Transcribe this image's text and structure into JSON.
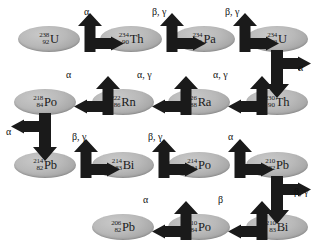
{
  "diagram": {
    "colors": {
      "background": "#ffffff",
      "node_fill": "#b9b9b9",
      "node_shadow": "#9a9a9a",
      "arrow": "#1a1a1a",
      "text": "#111111"
    }
  },
  "nodes": [
    {
      "id": "u238",
      "mass": "238",
      "atomic": "92",
      "symbol": "U",
      "x": 18,
      "y": 26
    },
    {
      "id": "th234",
      "mass": "234",
      "atomic": "90",
      "symbol": "Th",
      "x": 100,
      "y": 26
    },
    {
      "id": "pa234",
      "mass": "234",
      "atomic": "91",
      "symbol": "Pa",
      "x": 173,
      "y": 26
    },
    {
      "id": "u234",
      "mass": "234",
      "atomic": "92",
      "symbol": "U",
      "x": 246,
      "y": 26
    },
    {
      "id": "th230",
      "mass": "230",
      "atomic": "90",
      "symbol": "Th",
      "x": 246,
      "y": 89
    },
    {
      "id": "ra226",
      "mass": "226",
      "atomic": "88",
      "symbol": "Ra",
      "x": 168,
      "y": 89
    },
    {
      "id": "rn222",
      "mass": "222",
      "atomic": "86",
      "symbol": "Rn",
      "x": 92,
      "y": 89
    },
    {
      "id": "po218",
      "mass": "218",
      "atomic": "84",
      "symbol": "Po",
      "x": 14,
      "y": 89
    },
    {
      "id": "pb214",
      "mass": "214",
      "atomic": "82",
      "symbol": "Pb",
      "x": 14,
      "y": 152
    },
    {
      "id": "bi214",
      "mass": "214",
      "atomic": "83",
      "symbol": "Bi",
      "x": 92,
      "y": 152
    },
    {
      "id": "po214",
      "mass": "214",
      "atomic": "84",
      "symbol": "Po",
      "x": 168,
      "y": 152
    },
    {
      "id": "pb210",
      "mass": "210",
      "atomic": "82",
      "symbol": "Pb",
      "x": 246,
      "y": 152
    },
    {
      "id": "bi210",
      "mass": "210",
      "atomic": "83",
      "symbol": "Bi",
      "x": 246,
      "y": 214
    },
    {
      "id": "po210",
      "mass": "210",
      "atomic": "84",
      "symbol": "Po",
      "x": 168,
      "y": 214
    },
    {
      "id": "pb206",
      "mass": "206",
      "atomic": "82",
      "symbol": "Pb",
      "x": 92,
      "y": 214
    }
  ],
  "decays": [
    {
      "id": "d1",
      "from": "u238",
      "to": "th234",
      "emission": "α",
      "direction": "right",
      "label_x": 84,
      "label_y": 6
    },
    {
      "id": "d2",
      "from": "th234",
      "to": "pa234",
      "emission": "β, γ",
      "direction": "right",
      "label_x": 152,
      "label_y": 6
    },
    {
      "id": "d3",
      "from": "pa234",
      "to": "u234",
      "emission": "β, γ",
      "direction": "right",
      "label_x": 225,
      "label_y": 6
    },
    {
      "id": "d4",
      "from": "u234",
      "to": "th230",
      "emission": "α",
      "direction": "down",
      "label_x": 298,
      "label_y": 62
    },
    {
      "id": "d5",
      "from": "th230",
      "to": "ra226",
      "emission": "α, γ",
      "direction": "left",
      "label_x": 213,
      "label_y": 69
    },
    {
      "id": "d6",
      "from": "ra226",
      "to": "rn222",
      "emission": "α, γ",
      "direction": "left",
      "label_x": 137,
      "label_y": 69
    },
    {
      "id": "d7",
      "from": "rn222",
      "to": "po218",
      "emission": "α",
      "direction": "left",
      "label_x": 66,
      "label_y": 69
    },
    {
      "id": "d8",
      "from": "po218",
      "to": "pb214",
      "emission": "α",
      "direction": "down",
      "label_x": 6,
      "label_y": 126
    },
    {
      "id": "d9",
      "from": "pb214",
      "to": "bi214",
      "emission": "β, γ",
      "direction": "right",
      "label_x": 72,
      "label_y": 131
    },
    {
      "id": "d10",
      "from": "bi214",
      "to": "po214",
      "emission": "β, γ",
      "direction": "right",
      "label_x": 148,
      "label_y": 131
    },
    {
      "id": "d11",
      "from": "po214",
      "to": "pb210",
      "emission": "α",
      "direction": "right",
      "label_x": 228,
      "label_y": 131
    },
    {
      "id": "d12",
      "from": "pb210",
      "to": "bi210",
      "emission": "β, γ",
      "direction": "down",
      "label_x": 294,
      "label_y": 186
    },
    {
      "id": "d13",
      "from": "bi210",
      "to": "po210",
      "emission": "β",
      "direction": "left",
      "label_x": 218,
      "label_y": 194
    },
    {
      "id": "d14",
      "from": "po210",
      "to": "pb206",
      "emission": "α",
      "direction": "left",
      "label_x": 143,
      "label_y": 194
    }
  ]
}
